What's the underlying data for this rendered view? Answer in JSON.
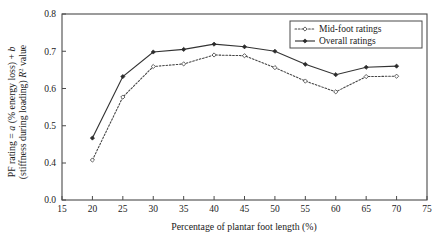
{
  "chart_data": {
    "type": "line",
    "title": "",
    "xlabel": "Percentage of plantar foot length (%)",
    "ylabel_line1": "PF rating = a (% energy loss) + b",
    "ylabel_line2": "(stiffness during loading) R2 value",
    "ylabel_plain": "PF rating = a (% energy loss) + b (stiffness during loading) R2 value",
    "x": [
      20,
      25,
      30,
      35,
      40,
      45,
      50,
      55,
      60,
      65,
      70
    ],
    "xlim": [
      15,
      75
    ],
    "ylim": [
      0.4,
      0.8
    ],
    "xticks": [
      "15",
      "20",
      "25",
      "30",
      "35",
      "40",
      "45",
      "50",
      "55",
      "60",
      "65",
      "70",
      "75"
    ],
    "yticks": [
      "0.0",
      "0.4",
      "0.5",
      "0.6",
      "0.7",
      "0.8"
    ],
    "y_axis_broken": true,
    "y_axis_break_note": "axis jumps from 0.0 to 0.4",
    "grid": false,
    "legend_position": "top-right",
    "series": [
      {
        "name": "Mid-foot ratings",
        "style": "dotted",
        "marker": "open-diamond",
        "color": "#444444",
        "values": [
          0.408,
          0.577,
          0.659,
          0.666,
          0.69,
          0.688,
          0.656,
          0.62,
          0.591,
          0.632,
          0.633
        ]
      },
      {
        "name": "Overall ratings",
        "style": "solid",
        "marker": "filled-diamond",
        "color": "#2b2b2b",
        "values": [
          0.467,
          0.632,
          0.698,
          0.705,
          0.719,
          0.712,
          0.7,
          0.665,
          0.637,
          0.657,
          0.66
        ]
      }
    ]
  },
  "legend": {
    "items": [
      {
        "label": "Mid-foot ratings"
      },
      {
        "label": "Overall ratings"
      }
    ]
  }
}
